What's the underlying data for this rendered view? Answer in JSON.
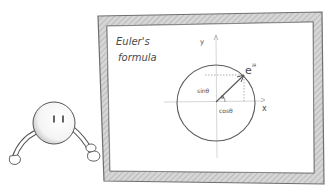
{
  "board": {
    "title_line1": "Euler's",
    "title_line2": "formula",
    "frame_color": "#8a8a8a",
    "frame_fill": "#c9c9c9",
    "ink_color": "#4a4a4a"
  },
  "diagram": {
    "y_label": "y",
    "x_label": "x",
    "point_label": "e",
    "point_exponent": "iθ",
    "sin_label": "sinθ",
    "cos_label": "cosθ",
    "angle_label": "θ"
  },
  "character": {
    "name": "round character"
  }
}
